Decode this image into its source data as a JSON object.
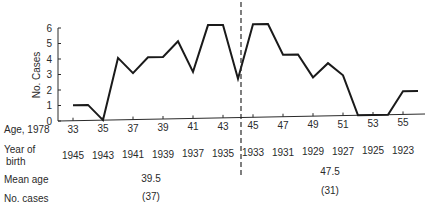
{
  "chart_data": {
    "type": "line",
    "title": "",
    "xlabel": "Age, 1978",
    "ylabel": "No. Cases",
    "ylim": [
      0,
      6
    ],
    "yticks": [
      0,
      1,
      2,
      3,
      4,
      5,
      6
    ],
    "grid": false,
    "legend": null,
    "x": [
      33,
      34,
      35,
      36,
      37,
      38,
      39,
      40,
      41,
      42,
      43,
      44,
      45,
      46,
      47,
      48,
      49,
      50,
      51,
      52,
      53,
      54,
      55,
      56
    ],
    "series": [
      {
        "name": "No. Cases",
        "values": [
          1,
          1,
          0,
          4,
          3,
          4,
          4,
          5,
          3,
          6,
          6,
          2.5,
          6,
          6,
          4,
          4,
          2.5,
          3.4,
          2.6,
          0,
          0,
          0,
          1.5,
          1.5
        ]
      }
    ],
    "age_tick_labels": [
      "33",
      "35",
      "37",
      "39",
      "41",
      "43",
      "45",
      "47",
      "49",
      "51",
      "53",
      "55"
    ],
    "year_of_birth_labels": [
      "1945",
      "1943",
      "1941",
      "1939",
      "1937",
      "1935",
      "1933",
      "1931",
      "1929",
      "1927",
      "1925",
      "1923"
    ],
    "divider_at_age": 44,
    "groups": [
      {
        "name": "left",
        "mean_age": "39.5",
        "n_cases": "(37)"
      },
      {
        "name": "right",
        "mean_age": "47.5",
        "n_cases": "(31)"
      }
    ],
    "row_labels": {
      "age": "Age, 1978",
      "year_of_birth_line1": "Year of",
      "year_of_birth_line2": "birth",
      "mean_age": "Mean age",
      "no_cases": "No. cases"
    }
  }
}
